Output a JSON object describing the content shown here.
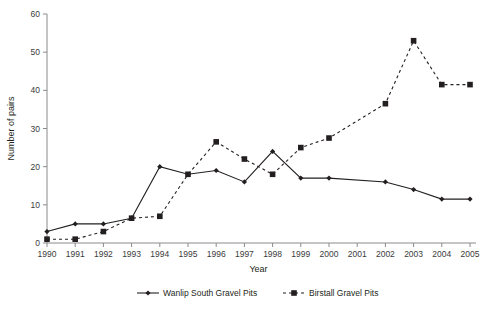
{
  "chart_data": {
    "type": "line",
    "title": "",
    "xlabel": "Year",
    "ylabel": "Number of pairs",
    "categories": [
      1990,
      1991,
      1992,
      1993,
      1994,
      1995,
      1996,
      1997,
      1998,
      1999,
      2000,
      2001,
      2002,
      2003,
      2004,
      2005
    ],
    "xlim": [
      1990,
      2005
    ],
    "ylim": [
      0,
      60
    ],
    "yticks": [
      0,
      10,
      20,
      30,
      40,
      50,
      60
    ],
    "xticks": [
      "1990",
      "1991",
      "1992",
      "1993",
      "1994",
      "1995",
      "1996",
      "1997",
      "1998",
      "1999",
      "2000",
      "2001",
      "2002",
      "2003",
      "2004",
      "2005"
    ],
    "grid": false,
    "legend_position": "bottom",
    "series": [
      {
        "name": "Wanlip South Gravel Pits",
        "marker": "diamond",
        "line_style": "solid",
        "color": "#231f20",
        "x": [
          1990,
          1991,
          1992,
          1993,
          1994,
          1995,
          1996,
          1997,
          1998,
          1999,
          2000,
          2002,
          2003,
          2004,
          2005
        ],
        "values": [
          3,
          5,
          5,
          6.5,
          20,
          18,
          19,
          16,
          24,
          17,
          17,
          16,
          14,
          11.5,
          11.5
        ]
      },
      {
        "name": "Birstall Gravel Pits",
        "marker": "square",
        "line_style": "dashed",
        "color": "#231f20",
        "x": [
          1990,
          1991,
          1992,
          1993,
          1994,
          1995,
          1996,
          1997,
          1998,
          1999,
          2000,
          2002,
          2003,
          2004,
          2005
        ],
        "values": [
          1,
          1,
          3,
          6.5,
          7,
          18,
          26.5,
          22,
          18,
          25,
          27.5,
          36.5,
          53,
          41.5,
          41.5
        ]
      }
    ]
  },
  "legend": {
    "entries": [
      {
        "label": "Wanlip South Gravel Pits"
      },
      {
        "label": "Birstall Gravel Pits"
      }
    ]
  },
  "axes": {
    "x_title": "Year",
    "y_title": "Number of pairs"
  }
}
